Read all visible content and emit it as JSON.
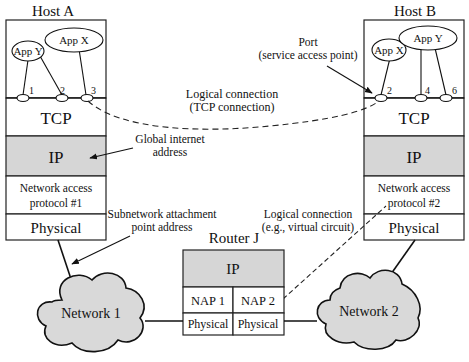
{
  "colors": {
    "layer_shaded": "#d6d6d6",
    "cloud_fill": "#d9d9d9",
    "stroke": "#111111",
    "background": "#ffffff"
  },
  "host_a": {
    "title": "Host A",
    "apps": [
      {
        "label": "App Y"
      },
      {
        "label": "App X"
      }
    ],
    "ports": [
      "1",
      "2",
      "3"
    ],
    "layers": {
      "tcp": "TCP",
      "ip": "IP",
      "nap_line1": "Network access",
      "nap_line2": "protocol #1",
      "physical": "Physical"
    }
  },
  "host_b": {
    "title": "Host B",
    "apps": [
      {
        "label": "App X"
      },
      {
        "label": "App Y"
      }
    ],
    "ports": [
      "2",
      "4",
      "6"
    ],
    "layers": {
      "tcp": "TCP",
      "ip": "IP",
      "nap_line1": "Network access",
      "nap_line2": "protocol #2",
      "physical": "Physical"
    }
  },
  "router": {
    "title": "Router J",
    "ip": "IP",
    "nap1": "NAP 1",
    "nap2": "NAP 2",
    "physical1": "Physical",
    "physical2": "Physical"
  },
  "networks": {
    "network1": "Network 1",
    "network2": "Network 2"
  },
  "annotations": {
    "port_line1": "Port",
    "port_line2": "(service access point)",
    "tcp_conn_line1": "Logical connection",
    "tcp_conn_line2": "(TCP connection)",
    "global_addr_line1": "Global internet",
    "global_addr_line2": "address",
    "subnet_addr_line1": "Subnetwork attachment",
    "subnet_addr_line2": "point address",
    "vc_line1": "Logical connection",
    "vc_line2": "(e.g., virtual circuit)"
  }
}
